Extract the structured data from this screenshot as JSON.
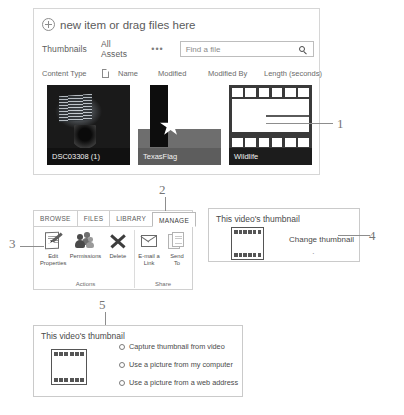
{
  "library": {
    "new_item": "new item or drag files here",
    "new_item_icon": "plus-circle-icon",
    "views": {
      "thumbnails": "Thumbnails",
      "all_assets": "All Assets",
      "more": "•••"
    },
    "search": {
      "placeholder": "Find a file",
      "value": "",
      "icon": "search-icon"
    },
    "columns": {
      "content_type": "Content Type",
      "doc_icon": "document-icon",
      "name": "Name",
      "modified": "Modified",
      "modified_by": "Modified By",
      "length": "Length (seconds)"
    },
    "items": [
      {
        "caption": "DSC03308 (1)",
        "kind": "photo"
      },
      {
        "caption": "TexasFlag",
        "kind": "image"
      },
      {
        "caption": "Wildlife",
        "kind": "video"
      }
    ]
  },
  "ribbon": {
    "tabs": [
      {
        "label": "BROWSE",
        "active": false
      },
      {
        "label": "FILES",
        "active": false
      },
      {
        "label": "LIBRARY",
        "active": false
      },
      {
        "label": "MANAGE",
        "active": true
      }
    ],
    "groups": [
      {
        "label": "Actions",
        "buttons": [
          {
            "label": "Edit\nProperties",
            "line1": "Edit",
            "line2": "Properties",
            "icon": "edit-properties-icon"
          },
          {
            "label": "Permissions",
            "line1": "Permissions",
            "line2": "",
            "icon": "permissions-people-icon"
          },
          {
            "label": "Delete",
            "line1": "Delete",
            "line2": "",
            "icon": "delete-x-icon"
          }
        ]
      },
      {
        "label": "Share",
        "buttons": [
          {
            "label": "E-mail a Link",
            "line1": "E-mail a",
            "line2": "Link",
            "icon": "email-envelope-icon"
          },
          {
            "label": "Send To",
            "line1": "Send",
            "line2": "To",
            "icon": "send-to-pages-icon"
          }
        ]
      }
    ]
  },
  "change_panel": {
    "title": "This video's thumbnail",
    "film_icon": "filmstrip-icon",
    "change_link": "Change thumbnail",
    "dot": "·"
  },
  "options_panel": {
    "title": "This video's thumbnail",
    "film_icon": "filmstrip-icon",
    "options": [
      {
        "label": "Capture thumbnail from video",
        "selected": false
      },
      {
        "label": "Use a picture from my computer",
        "selected": false
      },
      {
        "label": "Use a picture from a web address",
        "selected": false
      }
    ]
  },
  "callouts": {
    "one": "1",
    "two": "2",
    "three": "3",
    "four": "4",
    "five": "5"
  }
}
